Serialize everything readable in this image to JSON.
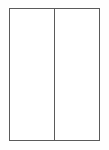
{
  "figure": {
    "name": "two-pane-frame",
    "background_color": "#fefefe",
    "fill_color": "#ffffff",
    "line_color": "#5a5a5a",
    "line_width_px": 1.5,
    "frame": {
      "x": 9,
      "y": 8,
      "width": 91,
      "height": 133
    },
    "divider": {
      "orientation": "vertical",
      "x": 54,
      "from_y": 8,
      "to_y": 141
    },
    "panes": [
      {
        "id": "left-pane",
        "label": "",
        "content": ""
      },
      {
        "id": "right-pane",
        "label": "",
        "content": ""
      }
    ]
  }
}
